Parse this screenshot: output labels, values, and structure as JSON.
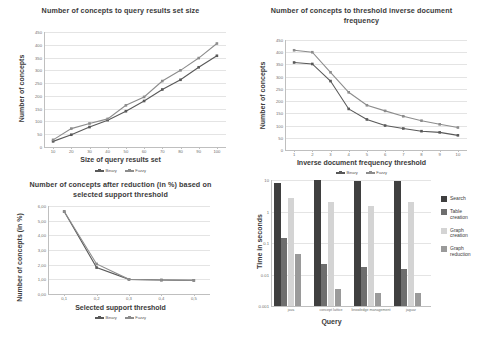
{
  "figure": {
    "caption": ""
  },
  "series_legend": {
    "binary": "Binary",
    "fuzzy": "Fuzzy"
  },
  "colors": {
    "binary": "#595959",
    "fuzzy": "#8c8c8c",
    "search": "#3f3f3f",
    "table_creation": "#6e6e6e",
    "graph_creation": "#d4d4d4",
    "graph_reduction": "#9a9a9a",
    "grid": "#e4e4e4",
    "axis": "#bfbfbf"
  },
  "chart_data": [
    {
      "id": "concepts-vs-resultset",
      "type": "line",
      "title": "Number of concepts to query results set size",
      "xlabel": "Size of query results set",
      "ylabel": "Number of concepts",
      "categories": [
        "10",
        "20",
        "30",
        "40",
        "50",
        "60",
        "70",
        "80",
        "90",
        "100"
      ],
      "xticklabels": [
        "10",
        "20",
        "30",
        "40",
        "50",
        "60",
        "70",
        "80",
        "90",
        "100"
      ],
      "yticklabels": [
        "0",
        "50",
        "100",
        "150",
        "200",
        "250",
        "300",
        "350",
        "400",
        "450"
      ],
      "ylim": [
        0,
        450
      ],
      "grid": true,
      "legend_position": "bottom",
      "series": [
        {
          "name": "Binary",
          "values": [
            22,
            48,
            78,
            105,
            140,
            180,
            225,
            263,
            312,
            357
          ]
        },
        {
          "name": "Fuzzy",
          "values": [
            28,
            72,
            92,
            110,
            163,
            196,
            258,
            300,
            348,
            405
          ]
        }
      ]
    },
    {
      "id": "concepts-vs-idf",
      "type": "line",
      "title": "Number of concepts to threshold inverse document frequency",
      "xlabel": "Inverse document frequency threshold",
      "ylabel": "Number of concepts",
      "categories": [
        "1",
        "2",
        "3",
        "4",
        "5",
        "6",
        "7",
        "8",
        "9",
        "10"
      ],
      "xticklabels": [
        "1",
        "2",
        "3",
        "4",
        "5",
        "6",
        "7",
        "8",
        "9",
        "10"
      ],
      "yticklabels": [
        "0",
        "50",
        "100",
        "150",
        "200",
        "250",
        "300",
        "350",
        "400",
        "450"
      ],
      "ylim": [
        0,
        450
      ],
      "grid": true,
      "legend_position": "bottom",
      "series": [
        {
          "name": "Binary",
          "values": [
            358,
            352,
            282,
            168,
            125,
            100,
            88,
            77,
            72,
            60
          ]
        },
        {
          "name": "Fuzzy",
          "values": [
            408,
            400,
            318,
            236,
            183,
            160,
            138,
            120,
            105,
            92
          ]
        }
      ]
    },
    {
      "id": "concepts-after-reduction",
      "type": "line",
      "title": "Number of concepts after reduction (in %) based on selected support threshold",
      "xlabel": "Selected support threshold",
      "ylabel": "Number of concepts (in %)",
      "categories": [
        "0,1",
        "0,2",
        "0,3",
        "0,4",
        "0,5"
      ],
      "xticklabels": [
        "0,1",
        "0,2",
        "0,3",
        "0,4",
        "0,5"
      ],
      "yticklabels": [
        "0,00",
        "1,00",
        "2,00",
        "3,00",
        "4,00",
        "5,00",
        "6,00"
      ],
      "ylim": [
        0,
        6
      ],
      "grid": true,
      "legend_position": "bottom",
      "series": [
        {
          "name": "Binary",
          "values": [
            5.62,
            1.8,
            1.0,
            0.95,
            0.93
          ]
        },
        {
          "name": "Fuzzy",
          "values": [
            5.62,
            2.05,
            1.0,
            0.95,
            0.93
          ]
        }
      ]
    },
    {
      "id": "time-per-query",
      "type": "bar",
      "title": "",
      "xlabel": "Query",
      "ylabel": "Time in seconds",
      "yscale": "log",
      "ylim": [
        0.001,
        10
      ],
      "yticklabels": [
        "0.001",
        "0.01",
        "0.1",
        "1",
        "10"
      ],
      "categories": [
        "java",
        "concept lattice",
        "knowledge management",
        "jaguar"
      ],
      "grid": true,
      "legend_position": "right",
      "series": [
        {
          "name": "Search",
          "values": [
            8.0,
            10.0,
            9.0,
            9.5
          ]
        },
        {
          "name": "Table creation",
          "values": [
            0.14,
            0.022,
            0.017,
            0.0145
          ]
        },
        {
          "name": "Graph creation",
          "values": [
            2.6,
            2.0,
            1.55,
            2.0
          ]
        },
        {
          "name": "Graph reduction",
          "values": [
            0.045,
            0.0035,
            0.0025,
            0.0025
          ]
        }
      ]
    }
  ]
}
